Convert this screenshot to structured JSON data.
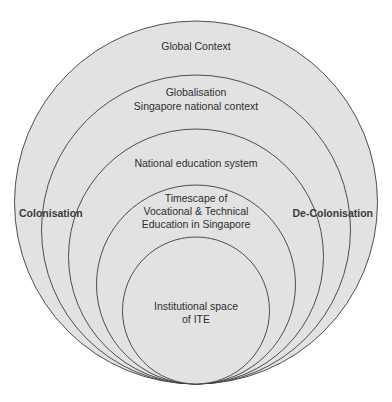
{
  "diagram": {
    "type": "nested-circles",
    "colors": {
      "background": "#ffffff",
      "circle_fill": "#e2e2e2",
      "circle_stroke": "#3c3c3c",
      "text": "#2e2e2e"
    },
    "circles": [
      {
        "id": "global",
        "lines": [
          "Global Context"
        ],
        "cx": 196,
        "cy": 202.5,
        "r": 181.5,
        "label_y": [
          50
        ]
      },
      {
        "id": "national",
        "lines": [
          "Globalisation",
          "Singapore national context"
        ],
        "cx": 196,
        "cy": 229.5,
        "r": 154.5,
        "label_y": [
          96,
          110
        ]
      },
      {
        "id": "education",
        "lines": [
          "National education system"
        ],
        "cx": 196,
        "cy": 256.5,
        "r": 127.5,
        "label_y": [
          167
        ]
      },
      {
        "id": "timescape",
        "lines": [
          "Timescape of",
          "Vocational & Technical",
          "Education in Singapore"
        ],
        "cx": 196,
        "cy": 284.5,
        "r": 99.5,
        "label_y": [
          202,
          215,
          228
        ]
      },
      {
        "id": "institution",
        "lines": [
          "Institutional space",
          "of ITE"
        ],
        "cx": 196,
        "cy": 310.5,
        "r": 73.5,
        "label_y": [
          310,
          323
        ]
      }
    ],
    "side_labels": {
      "left": "Colonisation",
      "right": "De-Colonisation"
    }
  }
}
